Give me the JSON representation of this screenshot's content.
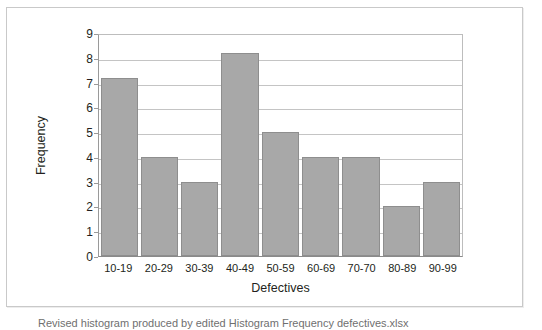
{
  "figure": {
    "caption": "Revised histogram produced by edited Histogram Frequency defectives.xlsx"
  },
  "chart_data": {
    "type": "bar",
    "title": "",
    "subtitle": "",
    "xlabel": "Defectives",
    "ylabel": "Frequency",
    "categories": [
      "10-19",
      "20-29",
      "30-39",
      "40-49",
      "50-59",
      "60-69",
      "70-70",
      "80-89",
      "90-99"
    ],
    "values": [
      7.2,
      4,
      3,
      8.2,
      5,
      4,
      4,
      2,
      3
    ],
    "ylim": [
      0,
      9
    ],
    "ytick_labels": [
      "0",
      "1",
      "2",
      "3",
      "4",
      "5",
      "6",
      "7",
      "8",
      "9"
    ],
    "yticks": [
      0,
      1,
      2,
      3,
      4,
      5,
      6,
      7,
      8,
      9
    ],
    "grid": true,
    "legend": false,
    "legend_position": "none",
    "bar_color": "#a8a8a8",
    "bar_edge_color": "#8e8e8e",
    "gridline_color": "#c4c4c4",
    "axis_color": "#8a8a8a",
    "frame_color": "#c9c9c9",
    "background": "#ffffff"
  }
}
